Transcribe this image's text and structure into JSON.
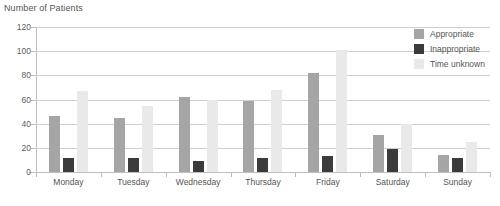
{
  "chart_data": {
    "type": "bar",
    "title": "Number of Patients",
    "xlabel": "",
    "ylabel": "Number of Patients",
    "ylim": [
      0,
      120
    ],
    "yticks": [
      0,
      20,
      40,
      60,
      80,
      100,
      120
    ],
    "grid": true,
    "legend_position": "top-right",
    "categories": [
      "Monday",
      "Tuesday",
      "Wednesday",
      "Thursday",
      "Friday",
      "Saturday",
      "Sunday"
    ],
    "series": [
      {
        "name": "Appropriate",
        "color": "#a5a5a5",
        "values": [
          46,
          45,
          62,
          59,
          82,
          31,
          14
        ]
      },
      {
        "name": "Inappropriate",
        "color": "#3b3b3b",
        "values": [
          12,
          12,
          9,
          12,
          13,
          19,
          12
        ]
      },
      {
        "name": "Time unknown",
        "color": "#e9e9e9",
        "values": [
          67,
          55,
          60,
          68,
          101,
          40,
          25
        ]
      }
    ]
  },
  "colors": {
    "appropriate": "#a5a5a5",
    "inappropriate": "#3b3b3b",
    "time_unknown": "#e9e9e9",
    "gridline": "#cfcfcf",
    "axis": "#bdbdbd",
    "text": "#555555",
    "background": "#ffffff"
  }
}
